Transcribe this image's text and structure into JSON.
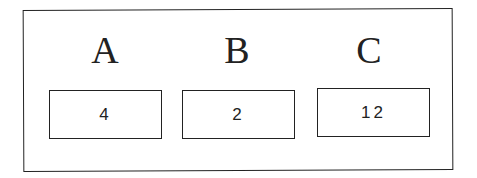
{
  "items": [
    {
      "label": "A",
      "value": "4"
    },
    {
      "label": "B",
      "value": "2"
    },
    {
      "label": "C",
      "value": "12"
    }
  ]
}
